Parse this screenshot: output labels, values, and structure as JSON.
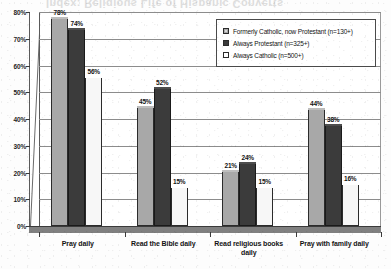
{
  "scan_artifact": {
    "ghost_text": "Index: Religious Life of Hispanic Converts"
  },
  "chart_data": {
    "type": "bar",
    "title": "",
    "subtitle": "",
    "xlabel": "",
    "ylabel": "",
    "ylim": [
      0,
      80
    ],
    "y_tick_labels": [
      "0%",
      "10%",
      "20%",
      "30%",
      "40%",
      "50%",
      "60%",
      "70%",
      "80%"
    ],
    "y_tick_values": [
      0,
      10,
      20,
      30,
      40,
      50,
      60,
      70,
      80
    ],
    "grid": true,
    "legend_position": "top-right",
    "value_label_suffix": "%",
    "categories": [
      "Pray daily",
      "Read the Bible daily",
      "Read religious books daily",
      "Pray with family daily"
    ],
    "series": [
      {
        "name": "Formerly Catholic, now Protestant (n=130+)",
        "short_name": "Formerly Catholic, now Protestant",
        "n": "n=130+",
        "color": "#a8a8a8",
        "values": [
          78,
          45,
          21,
          44
        ],
        "value_labels": [
          "78%",
          "45%",
          "21%",
          "44%"
        ]
      },
      {
        "name": "Always Protestant (n=325+)",
        "short_name": "Always Protestant",
        "n": "n=325+",
        "color": "#3b3b3b",
        "values": [
          74,
          52,
          24,
          38
        ],
        "value_labels": [
          "74%",
          "52%",
          "24%",
          "38%"
        ]
      },
      {
        "name": "Always Catholic (n=500+)",
        "short_name": "Always Catholic",
        "n": "n=500+",
        "color": "#f7f7f7",
        "values": [
          56,
          15,
          15,
          16
        ],
        "value_labels": [
          "56%",
          "15%",
          "15%",
          "16%"
        ]
      }
    ]
  }
}
